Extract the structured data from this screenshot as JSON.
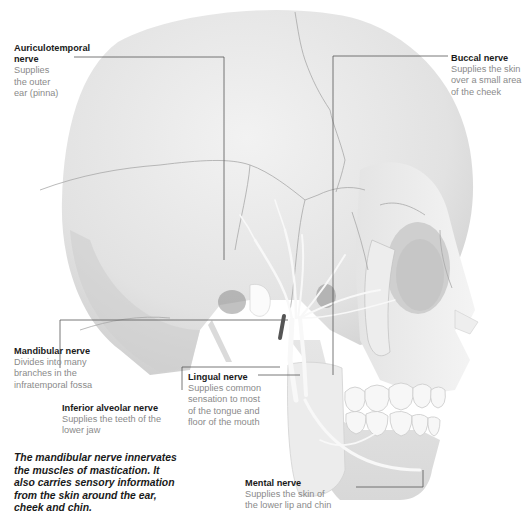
{
  "diagram": {
    "labels": [
      {
        "id": "auriculotemporal",
        "title": "Auriculotemporal\nnerve",
        "title_line1": "Auriculotemporal",
        "title_line2": "nerve",
        "description": "Supplies\nthe outer\near (pinna)"
      },
      {
        "id": "buccal",
        "title": "Buccal nerve",
        "description": "Supplies the skin\nover a small area\nof the cheek"
      },
      {
        "id": "mandibular",
        "title": "Mandibular nerve",
        "description": "Divides into many\nbranches in the\ninfratemporal fossa"
      },
      {
        "id": "inferior-alveolar",
        "title": "Inferior alveolar nerve",
        "description": "Supplies the teeth of the\nlower jaw"
      },
      {
        "id": "lingual",
        "title": "Lingual nerve",
        "description": "Supplies common\nsensation to most\nof the tongue and\nfloor of the mouth"
      },
      {
        "id": "mental",
        "title": "Mental nerve",
        "description": "Supplies the skin of\nthe lower lip and chin"
      }
    ],
    "caption": "The mandibular nerve innervates\nthe muscles of mastication. It\nalso carries sensory information\nfrom the skin around the ear,\ncheek and chin.",
    "colors": {
      "background": "#ffffff",
      "skull_light": "#ececec",
      "skull_shadow": "#c8c8c8",
      "suture": "#9a9a9a",
      "nerve": "#f7f7f7",
      "leader_line": "#555555",
      "label_title": "#1a1a1a",
      "label_desc": "#8a8a8a"
    }
  }
}
